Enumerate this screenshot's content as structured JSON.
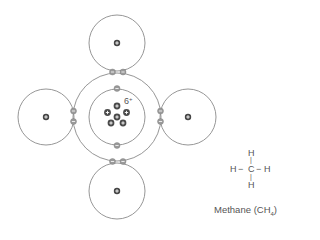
{
  "diagram": {
    "carbon_nucleus": {
      "label": "6+",
      "charge": "+",
      "proton_count": 6
    },
    "hydrogen_nucleus_symbol": "+",
    "electron_symbol": "−",
    "colors": {
      "line": "#888888",
      "electron_fill": "#9a9a9a",
      "nucleus_fill": "#444444",
      "text": "#555555"
    }
  },
  "structural_formula": {
    "top": "H",
    "left": "H",
    "center": "C",
    "right": "H",
    "bottom": "H",
    "dash": "−",
    "bar": "|"
  },
  "caption": {
    "name": "Methane",
    "formula_open": "(CH",
    "subscript": "4",
    "formula_close": ")"
  }
}
